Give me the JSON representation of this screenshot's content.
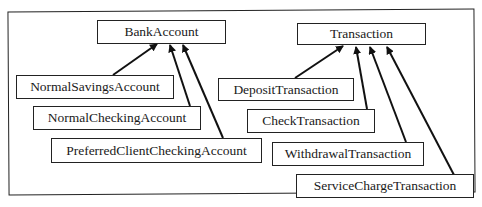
{
  "diagram": {
    "type": "class-inheritance",
    "left_hierarchy": {
      "parent": "BankAccount",
      "children": [
        "NormalSavingsAccount",
        "NormalCheckingAccount",
        "PreferredClientCheckingAccount"
      ]
    },
    "right_hierarchy": {
      "parent": "Transaction",
      "children": [
        "DepositTransaction",
        "CheckTransaction",
        "WithdrawalTransaction",
        "ServiceChargeTransaction"
      ]
    }
  },
  "boxes": {
    "bank_account": "BankAccount",
    "normal_savings": "NormalSavingsAccount",
    "normal_checking": "NormalCheckingAccount",
    "preferred_client": "PreferredClientCheckingAccount",
    "transaction": "Transaction",
    "deposit": "DepositTransaction",
    "check": "CheckTransaction",
    "withdrawal": "WithdrawalTransaction",
    "service_charge": "ServiceChargeTransaction"
  }
}
